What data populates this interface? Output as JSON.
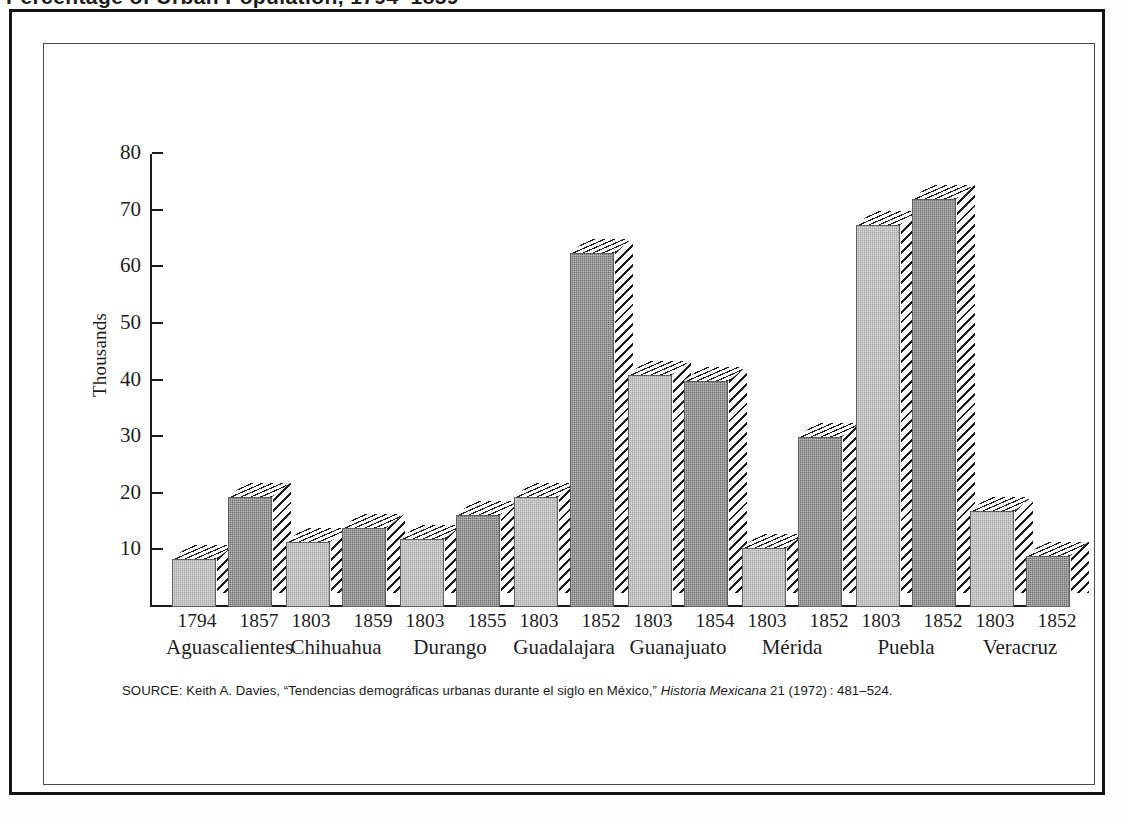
{
  "page": {
    "cut_off_heading": "Percentage of Urban Population, 1794–1859"
  },
  "chart_data": {
    "type": "bar",
    "title": "",
    "xlabel": "",
    "ylabel": "Thousands",
    "ylim": [
      0,
      80
    ],
    "yticks": [
      10,
      20,
      30,
      40,
      50,
      60,
      70,
      80
    ],
    "grid": false,
    "legend": "none",
    "categories": [
      "Aguascalientes",
      "Chihuahua",
      "Durango",
      "Guadalajara",
      "Guanajuato",
      "Mérida",
      "Puebla",
      "Veracruz"
    ],
    "groups": [
      {
        "city": "Aguascalientes",
        "bars": [
          {
            "year": "1794",
            "value": 8.5,
            "shade": "light"
          },
          {
            "year": "1857",
            "value": 19.5,
            "shade": "dark"
          }
        ]
      },
      {
        "city": "Chihuahua",
        "bars": [
          {
            "year": "1803",
            "value": 11.5,
            "shade": "light"
          },
          {
            "year": "1859",
            "value": 14,
            "shade": "dark"
          }
        ]
      },
      {
        "city": "Durango",
        "bars": [
          {
            "year": "1803",
            "value": 12,
            "shade": "light"
          },
          {
            "year": "1855",
            "value": 16.2,
            "shade": "dark"
          }
        ]
      },
      {
        "city": "Guadalajara",
        "bars": [
          {
            "year": "1803",
            "value": 19.5,
            "shade": "light"
          },
          {
            "year": "1852",
            "value": 62.5,
            "shade": "dark"
          }
        ]
      },
      {
        "city": "Guanajuato",
        "bars": [
          {
            "year": "1803",
            "value": 41,
            "shade": "light"
          },
          {
            "year": "1854",
            "value": 40,
            "shade": "dark"
          }
        ]
      },
      {
        "city": "Mérida",
        "bars": [
          {
            "year": "1803",
            "value": 10.5,
            "shade": "light"
          },
          {
            "year": "1852",
            "value": 30,
            "shade": "dark"
          }
        ]
      },
      {
        "city": "Puebla",
        "bars": [
          {
            "year": "1803",
            "value": 67.5,
            "shade": "light"
          },
          {
            "year": "1852",
            "value": 72,
            "shade": "dark"
          }
        ]
      },
      {
        "city": "Veracruz",
        "bars": [
          {
            "year": "1803",
            "value": 17,
            "shade": "light"
          },
          {
            "year": "1852",
            "value": 9,
            "shade": "dark"
          }
        ]
      }
    ],
    "colors": {
      "light_bar": "#a9a9a9",
      "dark_bar": "#6f6f6f",
      "axis": "#1b1b1b",
      "hatch": "#1d1d1d",
      "background": "#ffffff"
    }
  },
  "source_note": {
    "prefix": "SOURCE: Keith A. Davies, “Tendencias demográficas urbanas durante el siglo en México,” ",
    "journal": "Historia Mexicana",
    "suffix": " 21 (1972) : 481–524."
  }
}
